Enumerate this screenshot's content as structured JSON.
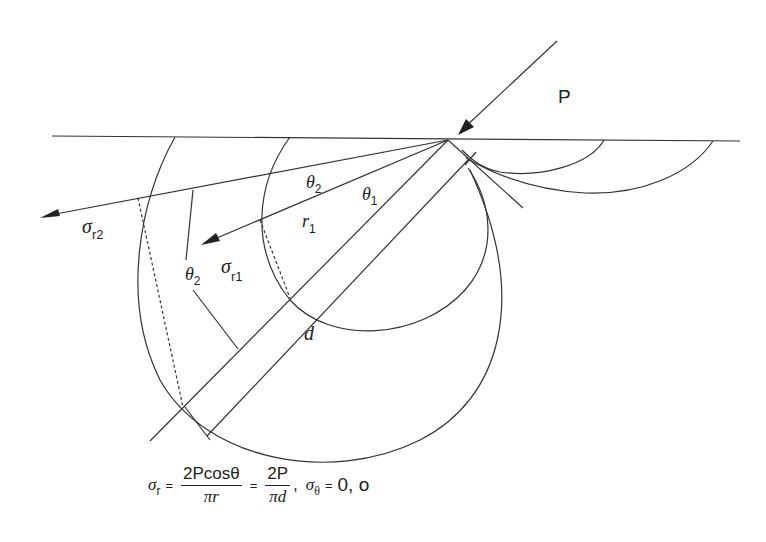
{
  "diagram": {
    "type": "stress distribution under inclined point load (Flamant / Boussinesq pressure bulbs)",
    "labels": {
      "load": "P",
      "sigma": "σ",
      "sigma_r2_sub": "r2",
      "sigma_r1_sub": "r1",
      "theta": "θ",
      "theta2_sub": "2",
      "theta1_sub": "1",
      "r": "r",
      "r1_sub": "1",
      "diameter": "d"
    }
  },
  "formula": {
    "lhs_symbol": "σ",
    "lhs_sub": "r",
    "eq1": "=",
    "frac1_num": "2Pcosθ",
    "frac1_den": "πr",
    "eq2": "=",
    "frac2_num": "2P",
    "frac2_den": "πd",
    "comma": ",",
    "rhs_symbol": "σ",
    "rhs_sub": "θ",
    "eq3": "=",
    "rhs_value": "0, o"
  }
}
